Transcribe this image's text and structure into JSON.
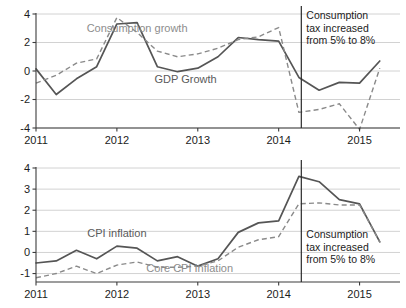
{
  "chart_data": [
    {
      "id": "growth-panel",
      "type": "line",
      "title": "",
      "xlabel": "",
      "ylabel": "",
      "xlim": [
        2011.0,
        2015.5
      ],
      "ylim": [
        -4,
        4
      ],
      "grid": true,
      "legend_position": "inline-annotation",
      "xticks": [
        "2011",
        "2012",
        "2013",
        "2014",
        "2015"
      ],
      "xtick_values": [
        2011,
        2012,
        2013,
        2014,
        2015
      ],
      "yticks": [
        "4",
        "2",
        "0",
        "-2",
        "-4"
      ],
      "ytick_values": [
        4,
        2,
        0,
        -2,
        -4
      ],
      "x": [
        2011.0,
        2011.25,
        2011.5,
        2011.75,
        2012.0,
        2012.25,
        2012.5,
        2012.75,
        2013.0,
        2013.25,
        2013.5,
        2013.75,
        2014.0,
        2014.25,
        2014.5,
        2014.75,
        2015.0,
        2015.25
      ],
      "series": [
        {
          "name": "GDP Growth",
          "style": "solid",
          "color": "#555555",
          "values": [
            0.15,
            -1.65,
            -0.55,
            0.3,
            3.3,
            3.4,
            0.3,
            -0.05,
            0.2,
            1.0,
            2.35,
            2.2,
            2.1,
            -0.45,
            -1.35,
            -0.8,
            -0.85,
            0.7
          ],
          "label_text": "GDP Growth",
          "label_x": 2012.85,
          "label_y": -0.85
        },
        {
          "name": "Consumption growth",
          "style": "dashed",
          "color": "#8a8a8a",
          "values": [
            -0.85,
            -0.3,
            0.55,
            0.85,
            3.75,
            2.7,
            1.4,
            1.0,
            1.2,
            1.6,
            2.2,
            2.4,
            3.05,
            -2.9,
            -2.7,
            -2.3,
            -4.1,
            0.2
          ],
          "label_text": "Consumption growth",
          "label_x": 2012.25,
          "label_y": 2.75
        }
      ],
      "event_marker": {
        "x": 2014.28,
        "lines": [
          "Consumption",
          "tax increased",
          "from 5% to 8%"
        ]
      }
    },
    {
      "id": "inflation-panel",
      "type": "line",
      "title": "",
      "xlabel": "",
      "ylabel": "",
      "xlim": [
        2011.0,
        2015.5
      ],
      "ylim": [
        -1.4,
        4
      ],
      "grid": true,
      "legend_position": "inline-annotation",
      "xticks": [
        "2011",
        "2012",
        "2013",
        "2014",
        "2015"
      ],
      "xtick_values": [
        2011,
        2012,
        2013,
        2014,
        2015
      ],
      "yticks": [
        "4",
        "3",
        "2",
        "1",
        "0",
        "-1"
      ],
      "ytick_values": [
        4,
        3,
        2,
        1,
        0,
        -1
      ],
      "x": [
        2011.0,
        2011.25,
        2011.5,
        2011.75,
        2012.0,
        2012.25,
        2012.5,
        2012.75,
        2013.0,
        2013.25,
        2013.5,
        2013.75,
        2014.0,
        2014.25,
        2014.5,
        2014.75,
        2015.0,
        2015.25
      ],
      "series": [
        {
          "name": "CPI inflation",
          "style": "solid",
          "color": "#555555",
          "values": [
            -0.5,
            -0.4,
            0.1,
            -0.3,
            0.3,
            0.2,
            -0.4,
            -0.2,
            -0.65,
            -0.3,
            0.95,
            1.4,
            1.5,
            3.6,
            3.35,
            2.5,
            2.3,
            0.5
          ],
          "label_text": "CPI inflation",
          "label_x": 2012.0,
          "label_y": 0.72
        },
        {
          "name": "Core CPI Inflation",
          "style": "dashed",
          "color": "#9a9a9a",
          "values": [
            -1.2,
            -1.0,
            -0.65,
            -1.0,
            -0.6,
            -0.45,
            -0.7,
            -0.7,
            -0.65,
            -0.4,
            0.25,
            0.6,
            0.75,
            2.3,
            2.35,
            2.25,
            2.25,
            0.5
          ],
          "label_text": "Core CPI Inflation",
          "label_x": 2012.9,
          "label_y": -0.93
        }
      ],
      "event_marker": {
        "x": 2014.28,
        "lines": [
          "Consumption",
          "tax increased",
          "from 5% to 8%"
        ]
      }
    }
  ],
  "colors": {
    "solid_series": "#555555",
    "dashed_series": "#8a8a8a",
    "dashed_series_light": "#9a9a9a",
    "gridline": "#d2d2d2",
    "axis": "#3c3c3c",
    "text": "#1c1c1c",
    "label_gray": "#8d8d8d",
    "background": "#ffffff"
  }
}
